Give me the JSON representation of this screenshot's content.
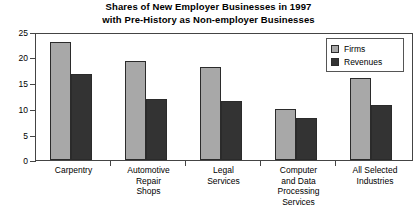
{
  "chart_data": {
    "type": "bar",
    "title": "Shares of New Employer Businesses in 1997 with Pre-History as Non-employer Businesses",
    "title_lines": [
      "Shares of New Employer Businesses in 1997",
      "with Pre-History as Non-employer Businesses"
    ],
    "categories": [
      "Carpentry",
      "Automotive Repair Shops",
      "Legal Services",
      "Computer and Data Processing Services",
      "All Selected Industries"
    ],
    "category_lines": [
      [
        "Carpentry"
      ],
      [
        "Automotive",
        "Repair",
        "Shops"
      ],
      [
        "Legal",
        "Services"
      ],
      [
        "Computer",
        "and Data",
        "Processing",
        "Services"
      ],
      [
        "All Selected",
        "Industries"
      ]
    ],
    "series": [
      {
        "name": "Firms",
        "color": "#a8a8a8",
        "values": [
          23.5,
          19.6,
          18.4,
          10.2,
          16.3
        ]
      },
      {
        "name": "Revenues",
        "color": "#333333",
        "values": [
          17.0,
          12.2,
          11.8,
          8.4,
          11.0
        ]
      }
    ],
    "legend": [
      "Firms",
      "Revenues"
    ],
    "legend_position": "top-right-inside",
    "xlabel": "",
    "ylabel": "",
    "ylim": [
      0,
      25
    ],
    "yticks": [
      0,
      5,
      10,
      15,
      20,
      25
    ],
    "ytick_labels": [
      "0",
      "5",
      "10",
      "15",
      "20",
      "25"
    ],
    "grid": false
  }
}
